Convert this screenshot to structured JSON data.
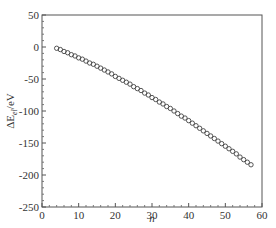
{
  "chart_data": {
    "type": "scatter",
    "title": "",
    "xlabel": "n",
    "ylabel": "ΔE_el/eV",
    "xlim": [
      0,
      60
    ],
    "ylim": [
      -250,
      50
    ],
    "xticks": [
      0,
      10,
      20,
      30,
      40,
      50,
      60
    ],
    "yticks": [
      50,
      0,
      -50,
      -100,
      -150,
      -200,
      -250
    ],
    "grid": false,
    "legend": null,
    "marker": "open-circle",
    "series": [
      {
        "name": "ΔE_el",
        "x": [
          4,
          5,
          6,
          7,
          8,
          9,
          10,
          11,
          12,
          13,
          14,
          15,
          16,
          17,
          18,
          19,
          20,
          21,
          22,
          23,
          24,
          25,
          26,
          27,
          28,
          29,
          30,
          31,
          32,
          33,
          34,
          35,
          36,
          37,
          38,
          39,
          40,
          41,
          42,
          43,
          44,
          45,
          46,
          47,
          48,
          49,
          50,
          51,
          52,
          53,
          54,
          55,
          56,
          57
        ],
        "y": [
          -2,
          -4,
          -7,
          -9,
          -12,
          -14,
          -17,
          -19,
          -22,
          -25,
          -27,
          -30,
          -33,
          -36,
          -39,
          -42,
          -46,
          -49,
          -52,
          -55,
          -58,
          -62,
          -65,
          -68,
          -72,
          -75,
          -79,
          -82,
          -86,
          -89,
          -93,
          -96,
          -100,
          -104,
          -108,
          -111,
          -115,
          -119,
          -123,
          -127,
          -131,
          -135,
          -139,
          -143,
          -147,
          -151,
          -155,
          -159,
          -163,
          -167,
          -172,
          -176,
          -180,
          -184
        ]
      }
    ]
  },
  "axes": {
    "x_title": "n",
    "y_title_main": "ΔE",
    "y_title_sub": "el",
    "y_title_unit": "/eV"
  }
}
